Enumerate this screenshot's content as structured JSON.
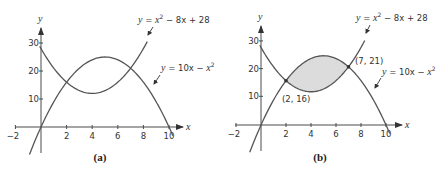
{
  "chart_data": [
    {
      "type": "line",
      "panel_label": "(a)",
      "xlabel": "x",
      "ylabel": "y",
      "x_ticks": [
        -2,
        2,
        4,
        6,
        8,
        10
      ],
      "y_ticks": [
        10,
        20,
        30
      ],
      "xlim": [
        -2,
        10.5
      ],
      "ylim": [
        -10,
        35
      ],
      "grid": false,
      "shaded_region": false,
      "series": [
        {
          "name": "y = x² − 8x + 28",
          "formula": "x^2 - 8x + 28",
          "x_range": [
            -0.1,
            8.3
          ]
        },
        {
          "name": "y = 10x − x²",
          "formula": "10x - x^2",
          "x_range": [
            -0.9,
            10.3
          ]
        }
      ],
      "annotations": []
    },
    {
      "type": "line",
      "panel_label": "(b)",
      "xlabel": "x",
      "ylabel": "y",
      "x_ticks": [
        -2,
        2,
        4,
        6,
        8,
        10
      ],
      "y_ticks": [
        10,
        20,
        30
      ],
      "xlim": [
        -2,
        10.5
      ],
      "ylim": [
        -10,
        35
      ],
      "grid": false,
      "shaded_region": {
        "between": [
          "10x - x^2",
          "x^2 - 8x + 28"
        ],
        "x_from": 2,
        "x_to": 7,
        "color": "#dcdcdc"
      },
      "series": [
        {
          "name": "y = x² − 8x + 28",
          "formula": "x^2 - 8x + 28",
          "x_range": [
            -0.1,
            8.3
          ]
        },
        {
          "name": "y = 10x − x²",
          "formula": "10x - x^2",
          "x_range": [
            -0.9,
            10.3
          ]
        }
      ],
      "annotations": [
        {
          "label": "(2, 16)",
          "x": 2,
          "y": 16
        },
        {
          "label": "(7, 21)",
          "x": 7,
          "y": 21
        }
      ]
    }
  ],
  "panels": [
    {
      "caption": "(a)",
      "eq1": {
        "y": "y",
        "eq": " = ",
        "x": "x",
        "sup": "2",
        "rest": " − 8x + 28"
      },
      "eq2": {
        "y": "y",
        "eq": " = 10x − ",
        "x": "x",
        "sup": "2"
      },
      "x_ticks": [
        "−2",
        "2",
        "4",
        "6",
        "8",
        "10"
      ],
      "y_ticks": [
        "10",
        "20",
        "30"
      ],
      "x_axis_label": "x",
      "y_axis_label": "y"
    },
    {
      "caption": "(b)",
      "eq1": {
        "y": "y",
        "eq": " = ",
        "x": "x",
        "sup": "2",
        "rest": " − 8x + 28"
      },
      "eq2": {
        "y": "y",
        "eq": " = 10x − ",
        "x": "x",
        "sup": "2"
      },
      "x_ticks": [
        "−2",
        "2",
        "4",
        "6",
        "8",
        "10"
      ],
      "y_ticks": [
        "10",
        "20",
        "30"
      ],
      "x_axis_label": "x",
      "y_axis_label": "y",
      "point1": "(2, 16)",
      "point2": "(7, 21)"
    }
  ],
  "colors": {
    "curve": "#555555",
    "axis": "#4a4a4a",
    "fill": "#dcdcdc",
    "text": "#333333"
  }
}
